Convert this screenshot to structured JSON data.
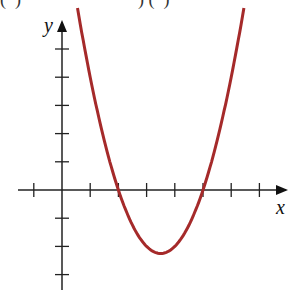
{
  "header": {
    "cut_text": "(  )                          ) (  )"
  },
  "chart_data": {
    "type": "line",
    "title": "",
    "xlabel": "x",
    "ylabel": "y",
    "function": "y = (x - 2)(x - 5)",
    "x_ticks": [
      -1,
      1,
      2,
      3,
      4,
      5,
      6,
      7
    ],
    "y_ticks": [
      -3,
      -2,
      -1,
      1,
      2,
      3,
      4,
      5
    ],
    "xlim": [
      -1.5,
      7.7
    ],
    "ylim": [
      -3.3,
      6
    ],
    "roots": [
      2,
      5
    ],
    "vertex": [
      3.5,
      -2.25
    ],
    "grid": false,
    "series": [
      {
        "name": "parabola",
        "color": "#a52a2a"
      }
    ]
  },
  "axes": {
    "x_label": "x",
    "y_label": "y"
  }
}
